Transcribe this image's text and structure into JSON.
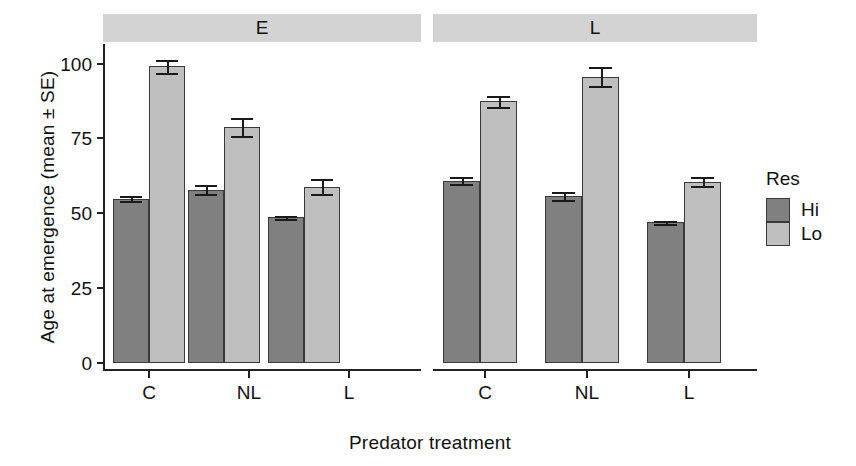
{
  "chart_data": {
    "type": "bar",
    "title": "",
    "xlabel": "Predator treatment",
    "ylabel": "Age at emergence (mean ± SE)",
    "ylim": [
      0,
      108
    ],
    "yticks": [
      0,
      25,
      50,
      75,
      100
    ],
    "ytick_labels": [
      "0",
      "25",
      "50",
      "75",
      "100"
    ],
    "grid": false,
    "legend": {
      "title": "Res",
      "position": "right",
      "entries": [
        {
          "name": "Hi",
          "color": "#808080"
        },
        {
          "name": "Lo",
          "color": "#bfbfbf"
        }
      ]
    },
    "panels": [
      {
        "label": "E",
        "categories": [
          "C",
          "NL",
          "L"
        ],
        "series": [
          {
            "name": "Hi",
            "values": [
              55.0,
              58.0,
              48.7
            ],
            "errors": [
              0.8,
              1.4,
              0.6
            ]
          },
          {
            "name": "Lo",
            "values": [
              99.2,
              78.8,
              59.0
            ],
            "errors": [
              2.2,
              3.0,
              2.6
            ]
          }
        ]
      },
      {
        "label": "L",
        "categories": [
          "C",
          "NL",
          "L"
        ],
        "series": [
          {
            "name": "Hi",
            "values": [
              61.0,
              55.8,
              47.0
            ],
            "errors": [
              1.1,
              1.3,
              0.5
            ]
          },
          {
            "name": "Lo",
            "values": [
              87.5,
              95.7,
              60.6
            ],
            "errors": [
              1.8,
              3.2,
              1.5
            ]
          }
        ]
      }
    ]
  },
  "axis": {
    "ytick_0": "0",
    "ytick_25": "25",
    "ytick_50": "50",
    "ytick_75": "75",
    "ytick_100": "100",
    "ylabel": "Age at emergence (mean ± SE)",
    "xlabel": "Predator treatment"
  },
  "panels": {
    "left_strip": "E",
    "right_strip": "L",
    "left_ticks": [
      "C",
      "NL",
      "L"
    ],
    "right_ticks": [
      "C",
      "NL",
      "L"
    ]
  },
  "legend": {
    "title": "Res",
    "hi": "Hi",
    "lo": "Lo"
  },
  "colors": {
    "hi": "#808080",
    "lo": "#bfbfbf",
    "strip": "#d3d3d3",
    "axis": "#222222"
  }
}
